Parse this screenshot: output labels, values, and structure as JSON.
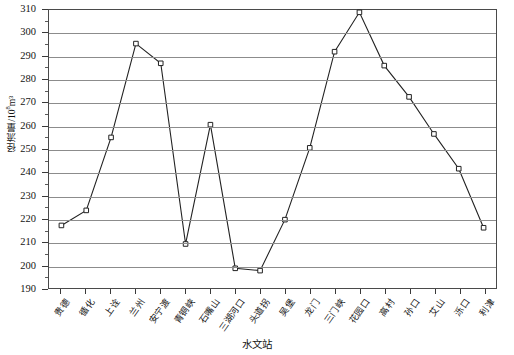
{
  "chart_data": {
    "type": "line",
    "title": "",
    "xlabel": "水文站",
    "ylabel": "径流量/10⁸m³",
    "ylabel_base": "径流量/10",
    "ylabel_exp": "8",
    "ylabel_unit": "m³",
    "ylim": [
      190,
      310
    ],
    "ytick_step": 10,
    "yticks": [
      190,
      200,
      210,
      220,
      230,
      240,
      250,
      260,
      270,
      280,
      290,
      300,
      310
    ],
    "ytick_labels": [
      "190",
      "200",
      "210",
      "220",
      "230",
      "240",
      "250",
      "260",
      "270",
      "280",
      "290",
      "300",
      "310"
    ],
    "grid": true,
    "grid_axis": "y",
    "legend": "none",
    "marker": "open-square",
    "line_color": "#222222",
    "marker_color": "#222222",
    "marker_fill": "#ffffff",
    "grid_color": "#8c8c8c",
    "axis_color": "#4a4a4a",
    "categories": [
      "贵德",
      "循化",
      "上诠",
      "兰州",
      "安宁渡",
      "青铜峡",
      "石嘴山",
      "三湖河口",
      "头道拐",
      "吴堡",
      "龙门",
      "三门峡",
      "花园口",
      "高村",
      "孙口",
      "艾山",
      "泺口",
      "利津"
    ],
    "values": [
      217,
      223.5,
      255,
      295.5,
      287,
      209,
      260.5,
      198.5,
      197.5,
      219.5,
      250.5,
      292,
      309,
      286,
      272.5,
      256.5,
      241.5,
      216
    ]
  }
}
